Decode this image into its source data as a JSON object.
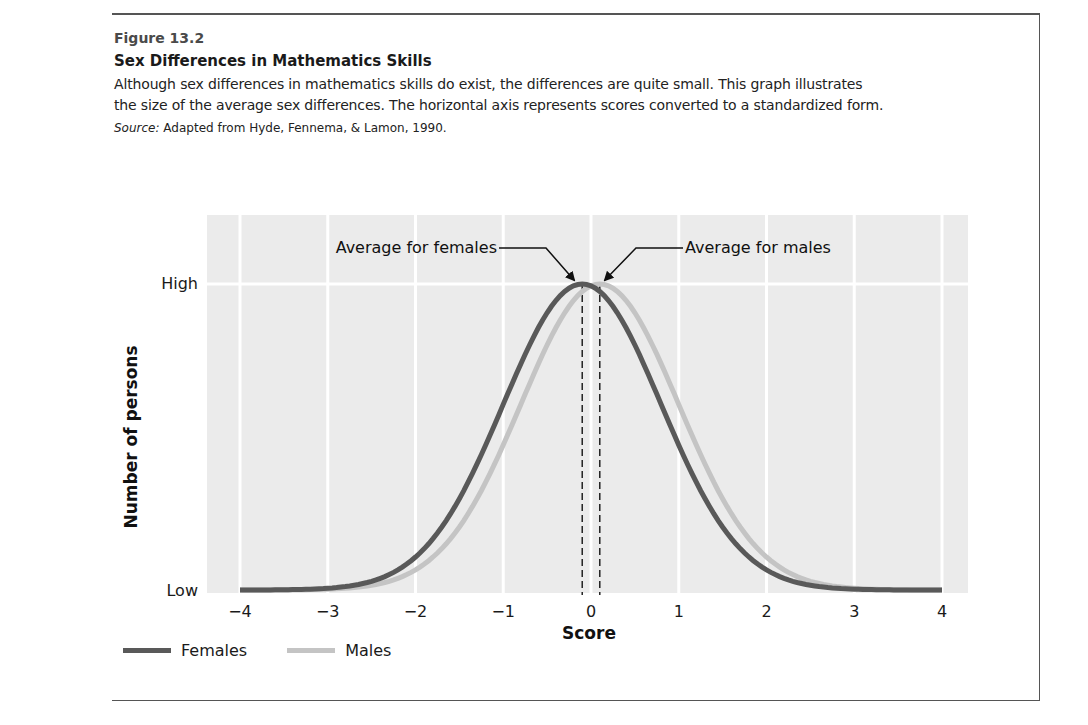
{
  "figure": {
    "number": "Figure 13.2",
    "title": "Sex Differences in Mathematics Skills",
    "caption_line1": "Although sex differences in mathematics skills do exist, the differences are quite small. This graph illustrates",
    "caption_line2": "the size of the average sex differences. The horizontal axis represents scores converted to a standardized form.",
    "source_label": "Source:",
    "source_text": " Adapted from Hyde, Fennema, & Lamon, 1990."
  },
  "colors": {
    "females": "#595959",
    "males": "#c4c4c4",
    "panel_bg": "#ebebeb",
    "grid": "#ffffff"
  },
  "chart_data": {
    "type": "line",
    "title": "Sex Differences in Mathematics Skills",
    "xlabel": "Score",
    "ylabel": "Number of persons",
    "x_ticks": [
      "−4",
      "−3",
      "−2",
      "−1",
      "0",
      "1",
      "2",
      "3",
      "4"
    ],
    "x_tick_values": [
      -4,
      -3,
      -2,
      -1,
      0,
      1,
      2,
      3,
      4
    ],
    "y_ticks": [
      "Low",
      "High"
    ],
    "xlim": [
      -4,
      4
    ],
    "ylim": [
      "Low",
      "High"
    ],
    "grid": true,
    "legend_position": "bottom-left",
    "series": [
      {
        "name": "Females",
        "distribution": "normal",
        "mean": -0.1,
        "sd": 0.9,
        "peak": "High"
      },
      {
        "name": "Males",
        "distribution": "normal",
        "mean": 0.1,
        "sd": 0.9,
        "peak": "High"
      }
    ],
    "annotations": [
      {
        "text": "Average for females",
        "x": -0.1,
        "style": "dashed vertical line + arrow to peak"
      },
      {
        "text": "Average for males",
        "x": 0.1,
        "style": "dashed vertical line + arrow to peak"
      }
    ]
  },
  "legend": {
    "females": "Females",
    "males": "Males"
  }
}
